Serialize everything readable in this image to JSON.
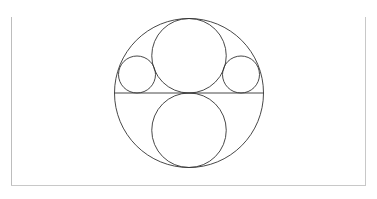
{
  "diagram": {
    "title": "",
    "stroke_color": "#333333",
    "frame_color": "#c4c4c4",
    "outer_circle": {
      "cx": 189,
      "cy": 93,
      "r": 74.5
    },
    "diameter_line": {
      "x1": 114.5,
      "y1": 93,
      "x2": 263.5,
      "y2": 93
    },
    "top_circle": {
      "cx": 189,
      "cy": 55.75,
      "r": 37.25
    },
    "bottom_circle": {
      "cx": 189,
      "cy": 130.25,
      "r": 37.25
    },
    "left_small_circle": {
      "cx": 137,
      "cy": 74.5,
      "r": 18.5
    },
    "right_small_circle": {
      "cx": 241,
      "cy": 74.5,
      "r": 18.5
    }
  }
}
